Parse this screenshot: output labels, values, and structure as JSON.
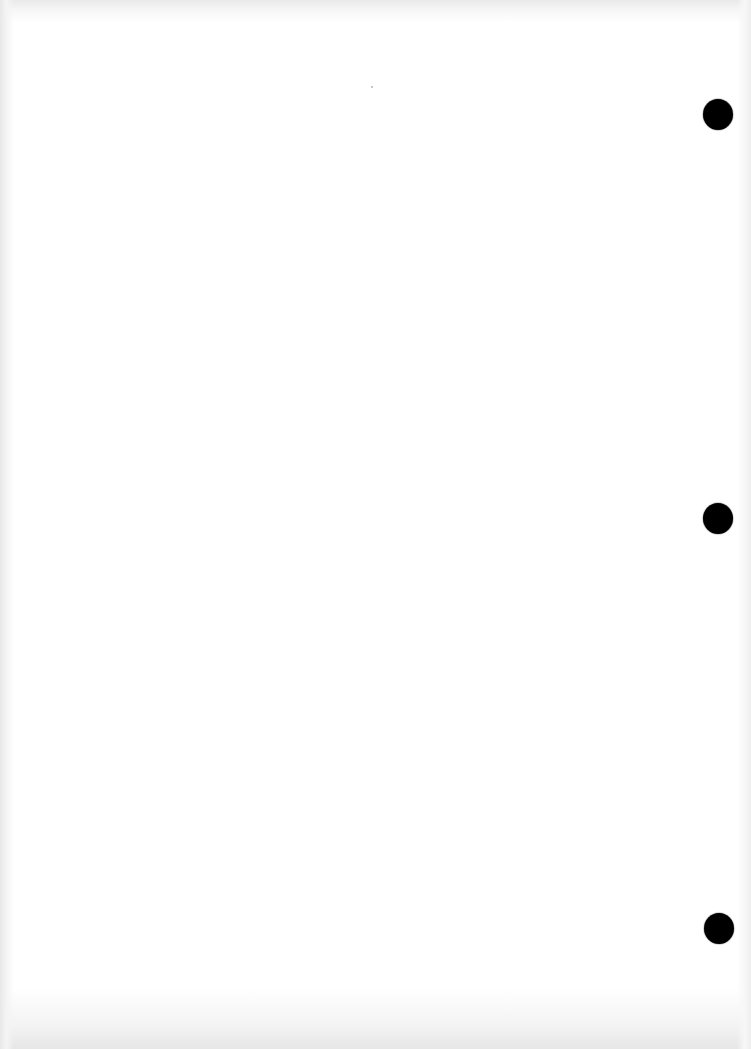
{
  "document": {
    "type": "blank-scanned-page",
    "background_color": "#ffffff",
    "edge_shade_color": "#e8e8e8",
    "text_content": ""
  },
  "punch_holes": [
    {
      "id": "top",
      "cx": 718,
      "cy": 114,
      "color": "#000000"
    },
    {
      "id": "middle",
      "cx": 718,
      "cy": 518,
      "color": "#000000"
    },
    {
      "id": "bottom",
      "cx": 719,
      "cy": 928,
      "color": "#000000"
    }
  ],
  "specks": [
    {
      "x": 372,
      "y": 87
    }
  ]
}
